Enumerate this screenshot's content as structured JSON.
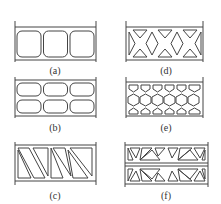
{
  "figure": {
    "panels": [
      {
        "id": "a",
        "label": "(a)",
        "core": "three rounded square cells, single row"
      },
      {
        "id": "b",
        "label": "(b)",
        "core": "rounded rectangular cells, two rows of three"
      },
      {
        "id": "c",
        "label": "(c)",
        "core": "triangular truss cells (diagonal web)"
      },
      {
        "id": "d",
        "label": "(d)",
        "core": "X-truss with triangular cells top and bottom"
      },
      {
        "id": "e",
        "label": "(e)",
        "core": "honeycomb hexagonal cells"
      },
      {
        "id": "f",
        "label": "(f)",
        "core": "double-layer triangular truss cells"
      }
    ]
  },
  "colors": {
    "stroke": "#444444",
    "background": "#ffffff"
  }
}
